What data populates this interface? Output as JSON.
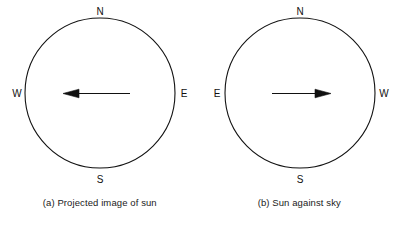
{
  "figure": {
    "background_color": "#ffffff",
    "stroke_color": "#111111",
    "text_color": "#1a1a1a",
    "panels": [
      {
        "id": "panel-a",
        "caption": "(a) Projected image of sun",
        "circle": {
          "center_x": 100,
          "center_y": 93,
          "radius": 75
        },
        "cardinals": {
          "north": "N",
          "south": "S",
          "west_side_label": "W",
          "east_side_label": "E",
          "left_label": "W",
          "right_label": "E"
        },
        "arrow": {
          "direction": "left",
          "points_toward": "W",
          "tail_x": 130,
          "head_x": 63,
          "y": 97
        }
      },
      {
        "id": "panel-b",
        "caption": "(b) Sun against sky",
        "circle": {
          "center_x": 100,
          "center_y": 93,
          "radius": 75
        },
        "cardinals": {
          "north": "N",
          "south": "S",
          "west_side_label": "W",
          "east_side_label": "E",
          "left_label": "E",
          "right_label": "W"
        },
        "arrow": {
          "direction": "right",
          "points_toward": "W",
          "tail_x": 72,
          "head_x": 131,
          "y": 97
        }
      }
    ]
  }
}
